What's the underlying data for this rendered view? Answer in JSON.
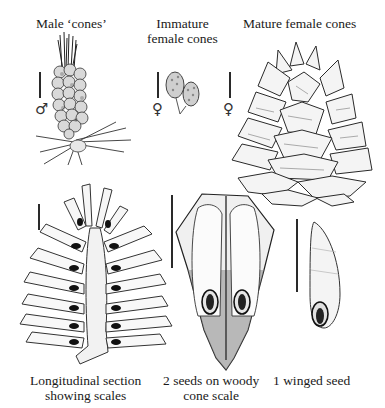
{
  "figure": {
    "panels": [
      {
        "id": "male-cones",
        "label": "Male ‘cones’",
        "sex_symbol": "♂"
      },
      {
        "id": "immature-female-cones",
        "label_line1": "Immature",
        "label_line2": "female cones",
        "sex_symbol": "♀"
      },
      {
        "id": "mature-female-cones",
        "label": "Mature female cones",
        "sex_symbol": "♀"
      },
      {
        "id": "longitudinal-section",
        "label_line1": "Longitudinal section",
        "label_line2": "showing scales"
      },
      {
        "id": "seeds-on-scale",
        "label_line1": "2 seeds on woody",
        "label_line2": "cone scale"
      },
      {
        "id": "winged-seed",
        "label": "1 winged seed"
      }
    ],
    "colors": {
      "ink": "#1a1a1a",
      "shade": "#555555",
      "paper": "#ffffff"
    }
  }
}
